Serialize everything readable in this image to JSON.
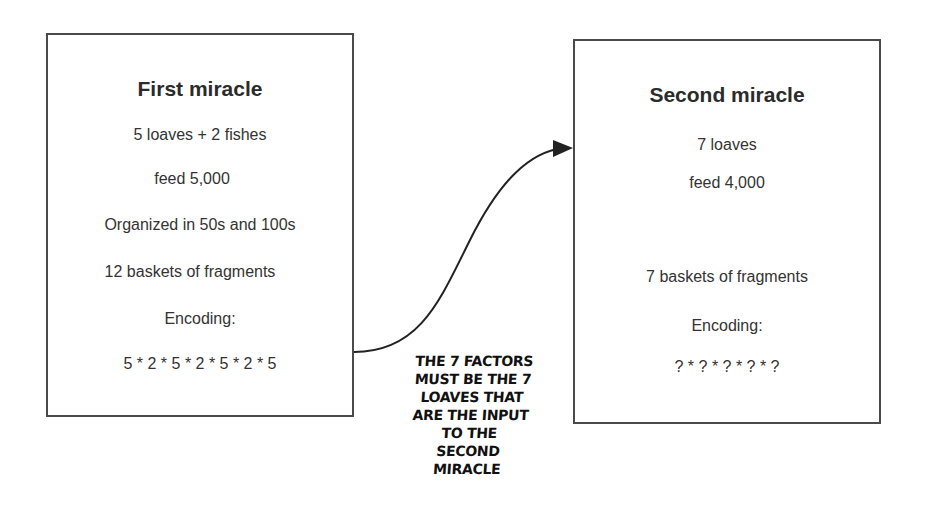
{
  "diagram": {
    "nodes": [
      {
        "id": "first-miracle",
        "title": "First miracle",
        "lines": [
          "5 loaves + 2 fishes",
          "feed 5,000",
          "Organized in 50s and 100s",
          "12 baskets of fragments",
          "Encoding:",
          "5 * 2 * 5 * 2 * 5 * 2 * 5"
        ]
      },
      {
        "id": "second-miracle",
        "title": "Second miracle",
        "lines": [
          "7 loaves",
          "feed 4,000",
          "7 baskets of fragments",
          "Encoding:",
          "? * ? * ? * ? * ?"
        ]
      }
    ],
    "edges": [
      {
        "from": "first-miracle",
        "to": "second-miracle",
        "style": "curved-arrow"
      }
    ],
    "annotation": {
      "lines": [
        "THE 7 FACTORS",
        "MUST BE THE 7",
        "LOAVES THAT",
        "ARE THE INPUT",
        "TO THE",
        "SECOND",
        "MIRACLE"
      ]
    },
    "colors": {
      "box_border": "#4a4a4a",
      "text": "#333333",
      "arrow": "#222222",
      "background": "#ffffff"
    }
  }
}
